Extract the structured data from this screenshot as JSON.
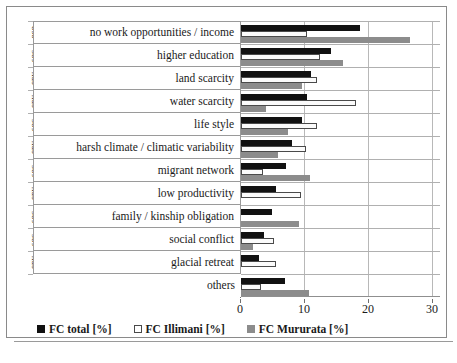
{
  "chart_data": {
    "type": "bar",
    "orientation": "horizontal",
    "title": "",
    "xlabel": "",
    "ylabel": "",
    "xlim": [
      0,
      30
    ],
    "xticks": [
      0,
      10,
      20,
      30
    ],
    "grid": true,
    "legend_position": "bottom",
    "categories": [
      "no work opportunities / income",
      "higher education",
      "land scarcity",
      "water scarcity",
      "life style",
      "harsh climate / climatic variability",
      "migrant network",
      "low productivity",
      "family / kinship obligation",
      "social conflict",
      "glacial retreat",
      "others"
    ],
    "category_groups": [
      "eco",
      "soc",
      "env",
      "env",
      "soc",
      "env",
      "soc",
      "env",
      "soc",
      "soc",
      "env",
      ""
    ],
    "series": [
      {
        "name": "FC total [%]",
        "color": "#111111",
        "values": [
          18.6,
          14.1,
          10.9,
          10.3,
          9.6,
          8.0,
          7.0,
          5.5,
          4.9,
          3.6,
          2.8,
          6.9
        ]
      },
      {
        "name": "FC Illimani [%]",
        "color": "#ffffff",
        "values": [
          10.3,
          12.3,
          11.9,
          18.0,
          11.9,
          10.2,
          3.4,
          9.3,
          0.0,
          5.2,
          5.4,
          3.1
        ]
      },
      {
        "name": "FC Mururata [%]",
        "color": "#8c8c8c",
        "values": [
          26.4,
          16.0,
          9.5,
          3.9,
          7.3,
          5.8,
          10.8,
          0.0,
          9.1,
          1.9,
          0.0,
          10.6
        ]
      }
    ]
  },
  "legend": {
    "items": [
      {
        "label": "FC total [%]",
        "swatch": "total"
      },
      {
        "label": "FC Illimani [%]",
        "swatch": "illimani"
      },
      {
        "label": "FC Mururata [%]",
        "swatch": "mururata"
      }
    ]
  },
  "xticks": [
    "0",
    "10",
    "20",
    "30"
  ]
}
